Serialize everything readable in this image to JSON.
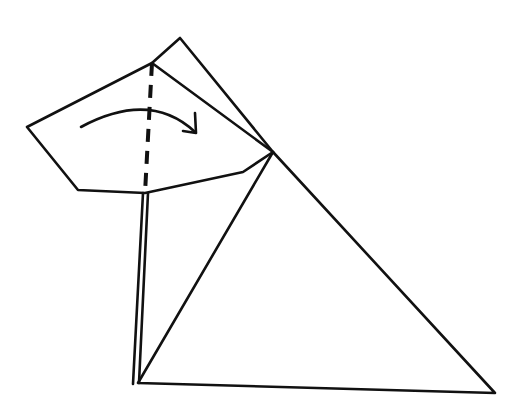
{
  "diagram": {
    "type": "origami-fold-step",
    "colors": {
      "ink": "#111111",
      "paper": "#ffffff"
    },
    "elements": {
      "big_triangle": {
        "points": [
          [
            273,
            152
          ],
          [
            138,
            383
          ],
          [
            495,
            393
          ]
        ]
      },
      "back_flap_edge": {
        "points": [
          [
            152,
            63
          ],
          [
            180,
            38
          ],
          [
            273,
            152
          ]
        ]
      },
      "front_flap": {
        "points": [
          [
            152,
            63
          ],
          [
            27,
            127
          ],
          [
            78,
            190
          ],
          [
            145,
            193
          ],
          [
            243,
            172
          ],
          [
            273,
            152
          ],
          [
            152,
            63
          ]
        ]
      },
      "double_edge_left": {
        "points": [
          [
            143,
            193
          ],
          [
            133,
            384
          ]
        ]
      },
      "double_edge_right": {
        "points": [
          [
            148,
            193
          ],
          [
            139,
            383
          ]
        ]
      },
      "crease_line": {
        "style": "dashed",
        "points": [
          [
            152,
            63
          ],
          [
            145,
            193
          ]
        ]
      },
      "fold_arrow": {
        "path": "M 81 127 Q 150 90 195 132",
        "head": [
          [
            183,
            131
          ],
          [
            196,
            133
          ],
          [
            195,
            113
          ]
        ],
        "direction": "left-to-right"
      }
    }
  }
}
